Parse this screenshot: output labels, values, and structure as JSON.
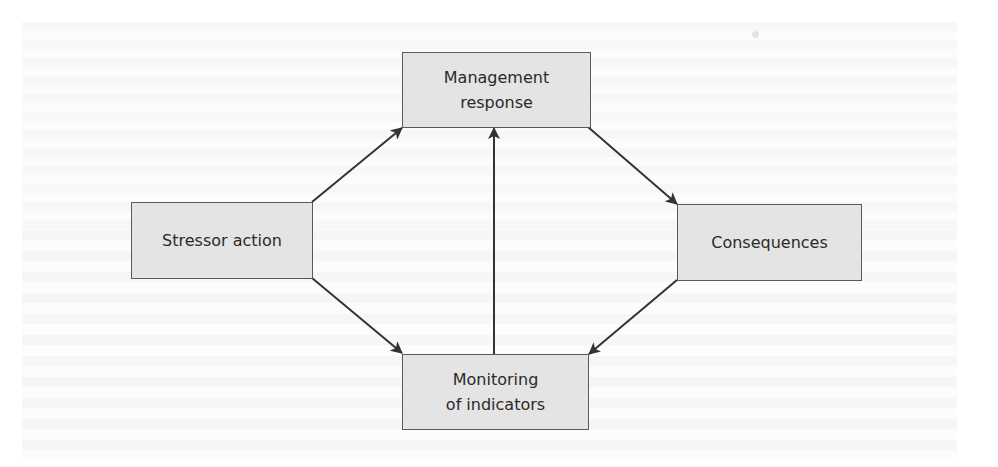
{
  "diagram": {
    "type": "cycle-flow",
    "nodes": [
      {
        "id": "management",
        "lines": [
          "Management",
          "response"
        ]
      },
      {
        "id": "stressor",
        "lines": [
          "Stressor action"
        ]
      },
      {
        "id": "consequences",
        "lines": [
          "Consequences"
        ]
      },
      {
        "id": "monitoring",
        "lines": [
          "Monitoring",
          "of indicators"
        ]
      }
    ],
    "edges": [
      {
        "from": "stressor",
        "to": "management"
      },
      {
        "from": "stressor",
        "to": "monitoring"
      },
      {
        "from": "management",
        "to": "consequences"
      },
      {
        "from": "consequences",
        "to": "monitoring"
      },
      {
        "from": "monitoring",
        "to": "management"
      }
    ],
    "colors": {
      "box_fill": "#e4e4e4",
      "box_border": "#5a5a5a",
      "arrow": "#333333",
      "text": "#2a2a2a"
    }
  }
}
